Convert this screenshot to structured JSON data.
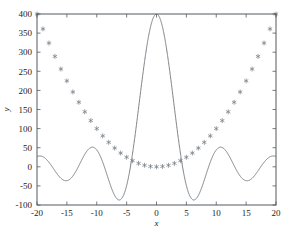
{
  "figure": {
    "background": "#ffffff",
    "frame_color": "#555a5e",
    "curve_color": "#6c7378",
    "marker_color": "#7a8086"
  },
  "chart_data": {
    "type": "line",
    "title": "",
    "xlabel": "x",
    "ylabel": "y",
    "xlim": [
      -20,
      20
    ],
    "ylim": [
      -100,
      400
    ],
    "xticks": [
      -20,
      -15,
      -10,
      -5,
      0,
      5,
      10,
      15,
      20
    ],
    "xtick_labels": [
      "-20",
      "-15",
      "-10",
      "-5",
      "0",
      "5",
      "10",
      "15",
      "20"
    ],
    "yticks": [
      -100,
      -50,
      0,
      50,
      100,
      150,
      200,
      250,
      300,
      350,
      400
    ],
    "ytick_labels": [
      "-100",
      "-50",
      "0",
      "50",
      "100",
      "150",
      "200",
      "250",
      "300",
      "350",
      "400"
    ],
    "grid": false,
    "legend": null,
    "series": [
      {
        "name": "parabola",
        "style": "scatter",
        "marker": "asterisk",
        "color": "#7a8086",
        "x": [
          -20,
          -19,
          -18,
          -17,
          -16,
          -15,
          -14,
          -13,
          -12,
          -11,
          -10,
          -9,
          -8,
          -7,
          -6,
          -5,
          -4,
          -3,
          -2,
          -1,
          0,
          1,
          2,
          3,
          4,
          5,
          6,
          7,
          8,
          9,
          10,
          11,
          12,
          13,
          14,
          15,
          16,
          17,
          18,
          19,
          20
        ],
        "y": [
          400,
          361,
          324,
          289,
          256,
          225,
          196,
          169,
          144,
          121,
          100,
          81,
          64,
          49,
          36,
          25,
          16,
          9,
          4,
          1,
          0,
          1,
          4,
          9,
          16,
          25,
          36,
          49,
          64,
          81,
          100,
          121,
          144,
          169,
          196,
          225,
          256,
          289,
          324,
          361,
          400
        ]
      },
      {
        "name": "oscillatory",
        "style": "line",
        "color": "#6c7378",
        "description": "sinc-like decaying oscillation peaking at 400 at x=0",
        "peak_value": 400,
        "peak_x": 0,
        "first_minimum_value": -85,
        "first_minimum_x": [
          -4.3,
          4.3
        ]
      }
    ]
  }
}
